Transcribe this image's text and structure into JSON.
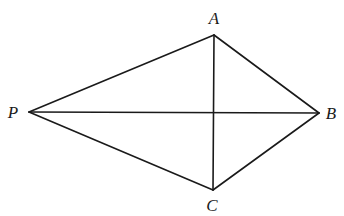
{
  "diagram": {
    "type": "geometry",
    "points": {
      "A": {
        "label": "A",
        "x": 214,
        "y": 35,
        "label_x": 214,
        "label_y": 24
      },
      "P": {
        "label": "P",
        "x": 29,
        "y": 112,
        "label_x": 13,
        "label_y": 118
      },
      "B": {
        "label": "B",
        "x": 319,
        "y": 113,
        "label_x": 331,
        "label_y": 119
      },
      "C": {
        "label": "C",
        "x": 213,
        "y": 190,
        "label_x": 212,
        "label_y": 211
      }
    },
    "segments": [
      {
        "from": "P",
        "to": "A"
      },
      {
        "from": "A",
        "to": "B"
      },
      {
        "from": "B",
        "to": "C"
      },
      {
        "from": "C",
        "to": "P"
      },
      {
        "from": "P",
        "to": "B"
      },
      {
        "from": "A",
        "to": "C"
      }
    ],
    "stroke_color": "#1a1a1a"
  }
}
